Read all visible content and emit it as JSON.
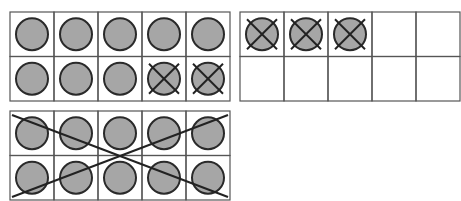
{
  "colors": {
    "background": "#ffffff",
    "grid_line": "#555555",
    "counter_fill": "#a6a6a6",
    "counter_stroke": "#2a2a2a",
    "cross_stroke": "#222222"
  },
  "ten_frames": [
    {
      "id": "frame-1",
      "rows": 2,
      "cols": 5,
      "cells": [
        "filled",
        "filled",
        "filled",
        "filled",
        "filled",
        "filled",
        "filled",
        "filled",
        "crossed",
        "crossed"
      ],
      "whole_frame_crossed": false
    },
    {
      "id": "frame-2",
      "rows": 2,
      "cols": 5,
      "cells": [
        "crossed",
        "crossed",
        "crossed",
        "empty",
        "empty",
        "empty",
        "empty",
        "empty",
        "empty",
        "empty"
      ],
      "whole_frame_crossed": false
    },
    {
      "id": "frame-3",
      "rows": 2,
      "cols": 5,
      "cells": [
        "filled",
        "filled",
        "filled",
        "filled",
        "filled",
        "filled",
        "filled",
        "filled",
        "filled",
        "filled"
      ],
      "whole_frame_crossed": true
    }
  ]
}
